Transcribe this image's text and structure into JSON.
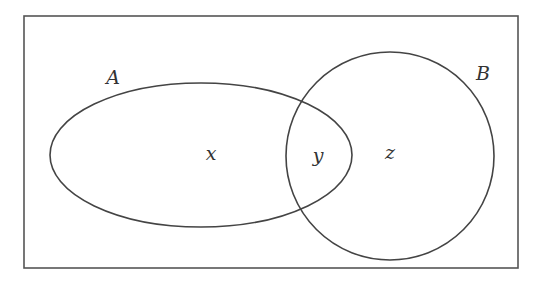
{
  "diagram": {
    "type": "venn",
    "universe": {
      "x": 24,
      "y": 16,
      "width": 494,
      "height": 252
    },
    "sets": [
      {
        "name": "A",
        "shape": "ellipse",
        "cx": 201,
        "cy": 155,
        "rx": 151,
        "ry": 72,
        "label_pos": [
          113,
          84
        ]
      },
      {
        "name": "B",
        "shape": "circle",
        "cx": 390,
        "cy": 156,
        "r": 104,
        "label_pos": [
          483,
          80
        ]
      }
    ],
    "regions": [
      {
        "label": "x",
        "description": "A only",
        "pos": [
          211,
          160
        ]
      },
      {
        "label": "y",
        "description": "A and B",
        "pos": [
          318,
          162
        ]
      },
      {
        "label": "z",
        "description": "B only",
        "pos": [
          390,
          159
        ]
      }
    ],
    "stroke_color": "#444444"
  }
}
